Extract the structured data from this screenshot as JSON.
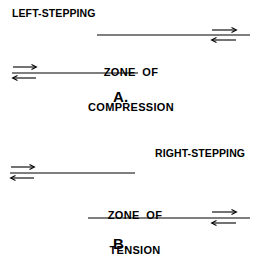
{
  "figure": {
    "title_a": "LEFT-STEPPING",
    "title_b": "RIGHT-STEPPING",
    "panel_a_letter": "A.",
    "panel_b_letter": "B.",
    "zone_a_line1": "ZONE  OF",
    "zone_a_line2": "COMPRESSION",
    "zone_b_line1": "ZONE  OF",
    "zone_b_line2": "TENSION",
    "stroke_color": "#000000",
    "background_color": "#ffffff",
    "panels": [
      {
        "id": "panel-a",
        "letter": "A.",
        "stepping": "LEFT-STEPPING",
        "zone_type": "COMPRESSION",
        "faults": [
          {
            "name": "upper-fault-trace",
            "x1": 97,
            "y1": 35,
            "x2": 250,
            "y2": 35,
            "arrow_end": "right",
            "top_arrow_direction": "right",
            "bottom_arrow_direction": "left"
          },
          {
            "name": "lower-fault-trace",
            "x1": 12,
            "y1": 73,
            "x2": 138,
            "y2": 73,
            "arrow_end": "left",
            "top_arrow_direction": "right",
            "bottom_arrow_direction": "left"
          }
        ]
      },
      {
        "id": "panel-b",
        "letter": "B.",
        "stepping": "RIGHT-STEPPING",
        "zone_type": "TENSION",
        "faults": [
          {
            "name": "upper-fault-trace",
            "x1": 10,
            "y1": 173,
            "x2": 135,
            "y2": 173,
            "arrow_end": "left",
            "top_arrow_direction": "right",
            "bottom_arrow_direction": "left"
          },
          {
            "name": "lower-fault-trace",
            "x1": 88,
            "y1": 218,
            "x2": 250,
            "y2": 218,
            "arrow_end": "right",
            "top_arrow_direction": "right",
            "bottom_arrow_direction": "left"
          }
        ]
      }
    ]
  }
}
